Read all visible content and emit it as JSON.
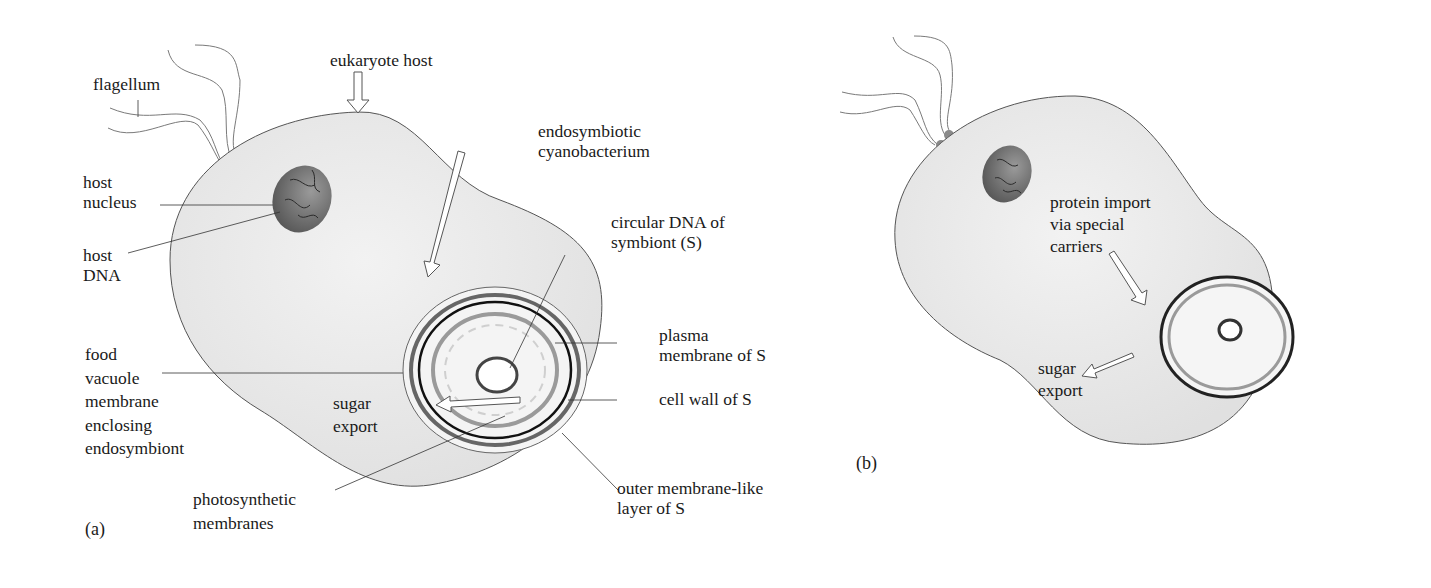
{
  "figure": {
    "panels": [
      {
        "id": "a",
        "panel_label": "(a)",
        "labels": {
          "flagellum": "flagellum",
          "eukaryote_host": "eukaryote host",
          "host_nucleus": "host\nnucleus",
          "host_dna": "host\nDNA",
          "endosymbiotic_cyanobacterium": "endosymbiotic\ncyanobacterium",
          "circular_dna": "circular DNA of\nsymbiont (S)",
          "plasma_membrane": "plasma\nmembrane of S",
          "cell_wall": "cell wall of S",
          "outer_membrane": "outer membrane-like\nlayer of S",
          "food_vacuole": "food\nvacuole\nmembrane\nenclosing\nendosymbiont",
          "sugar_export": "sugar\nexport",
          "photosynthetic_membranes": "photosynthetic\nmembranes"
        }
      },
      {
        "id": "b",
        "panel_label": "(b)",
        "labels": {
          "protein_import": "protein import\nvia special\ncarriers",
          "sugar_export": "sugar\nexport"
        }
      }
    ],
    "colors": {
      "cell_fill": "#e9e9e9",
      "outline": "#4a4a4a",
      "nucleus": "#6a6a6a",
      "dark_ring": "#1a1a1a",
      "mid_ring": "#707070",
      "light_ring": "#a8a8a8"
    }
  }
}
